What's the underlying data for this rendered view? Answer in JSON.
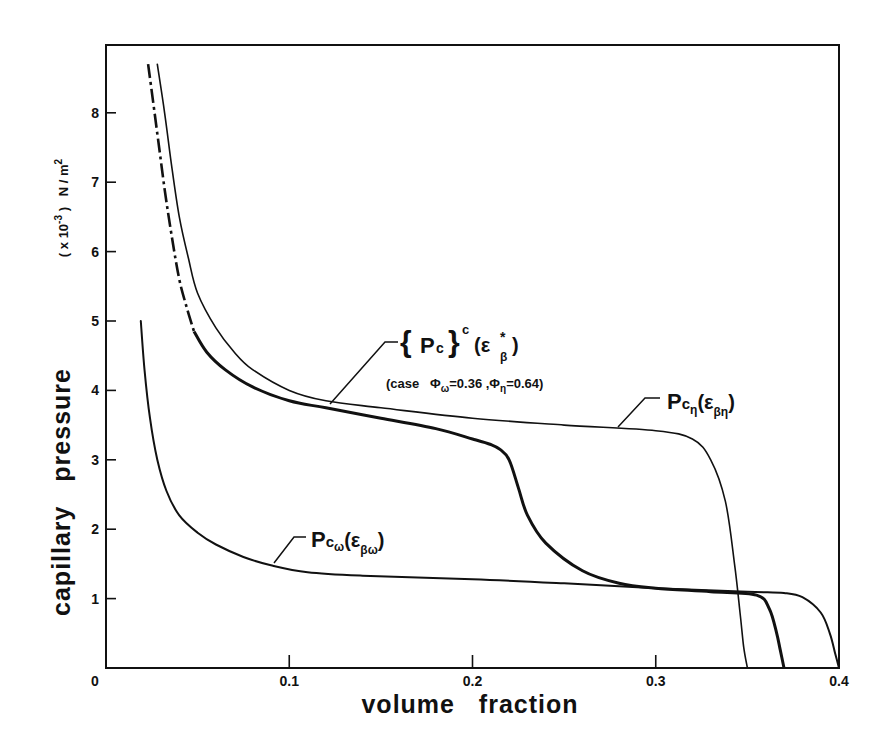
{
  "chart_data": {
    "type": "line",
    "title": "",
    "xlabel": "volume   fraction",
    "ylabel": "capillary   pressure",
    "ylabel_units": "( x10-3 )  N / m2",
    "xlim": [
      0,
      0.4
    ],
    "ylim": [
      0,
      9
    ],
    "grid": false,
    "legend": "inline annotations",
    "x_ticks": [
      "0",
      "0.1",
      "0.2",
      "0.3",
      "0.4"
    ],
    "y_ticks": [
      "0",
      "1",
      "2",
      "3",
      "4",
      "5",
      "6",
      "7",
      "8"
    ],
    "series": [
      {
        "name": "Pcη(εβη)",
        "style": "thin solid",
        "x": [
          0.028,
          0.032,
          0.036,
          0.04,
          0.045,
          0.05,
          0.06,
          0.07,
          0.08,
          0.1,
          0.12,
          0.15,
          0.2,
          0.25,
          0.3,
          0.32,
          0.33,
          0.338,
          0.343,
          0.346,
          0.348,
          0.35
        ],
        "values": [
          8.7,
          8.0,
          7.2,
          6.5,
          5.9,
          5.4,
          4.9,
          4.55,
          4.3,
          4.0,
          3.85,
          3.75,
          3.6,
          3.5,
          3.42,
          3.3,
          3.0,
          2.4,
          1.5,
          0.8,
          0.3,
          0.0
        ]
      },
      {
        "name": "{Pc}c(εβ*)",
        "note": "case Φω=0.36, Φη=0.64",
        "style": "thick solid (dash-dot for x<0.048)",
        "x": [
          0.023,
          0.028,
          0.032,
          0.036,
          0.04,
          0.044,
          0.048,
          0.055,
          0.065,
          0.08,
          0.1,
          0.12,
          0.15,
          0.18,
          0.2,
          0.21,
          0.215,
          0.22,
          0.225,
          0.23,
          0.24,
          0.26,
          0.28,
          0.3,
          0.33,
          0.355,
          0.362,
          0.366,
          0.368,
          0.37
        ],
        "values": [
          8.7,
          7.7,
          6.9,
          6.2,
          5.6,
          5.2,
          4.85,
          4.55,
          4.3,
          4.05,
          3.85,
          3.75,
          3.6,
          3.45,
          3.3,
          3.22,
          3.15,
          3.0,
          2.6,
          2.2,
          1.8,
          1.4,
          1.22,
          1.15,
          1.1,
          1.05,
          0.85,
          0.5,
          0.25,
          0.0
        ]
      },
      {
        "name": "Pcω(εβω)",
        "style": "medium solid",
        "x": [
          0.019,
          0.021,
          0.024,
          0.028,
          0.033,
          0.04,
          0.05,
          0.06,
          0.075,
          0.09,
          0.11,
          0.14,
          0.2,
          0.25,
          0.3,
          0.35,
          0.37,
          0.38,
          0.39,
          0.395,
          0.398,
          0.4
        ],
        "values": [
          5.0,
          4.3,
          3.6,
          3.0,
          2.55,
          2.2,
          1.95,
          1.78,
          1.6,
          1.48,
          1.38,
          1.33,
          1.28,
          1.22,
          1.15,
          1.1,
          1.08,
          1.02,
          0.8,
          0.5,
          0.2,
          0.0
        ]
      }
    ],
    "annotations": [
      {
        "text_main": "{ Pc }",
        "sup": "c",
        "args": "(ε",
        "args_sub": "β",
        "args_sup": "*",
        "close": ")"
      },
      {
        "text": "(case  Φω=0.36 ,Φη=0.64)"
      },
      {
        "text_main": "Pc",
        "sub": "η",
        "args": "(ε",
        "args_sub": "βη",
        "close": ")"
      },
      {
        "text_main": "Pc",
        "sub": "ω",
        "args": "(ε",
        "args_sub": "βω",
        "close": ")"
      }
    ]
  },
  "labels": {
    "xlabel": "volume   fraction",
    "ylabel": "capillary   pressure",
    "yunit_prefix": "( x 10",
    "yunit_exp": "-3",
    "yunit_suffix": " )   N / m",
    "yunit_sq": "2",
    "ann_pc_c_main": "{ P",
    "ann_pc_c_sub": "c",
    "ann_pc_c_brace": "}",
    "ann_pc_c_sup": "c",
    "ann_pc_c_arg": "(ε",
    "ann_pc_c_arg_sub": "β",
    "ann_pc_c_arg_sup": "*",
    "ann_pc_c_close": ")",
    "ann_case_prefix": "(case   Φ",
    "ann_case_w_sub": "ω",
    "ann_case_w_val": "=0.36 ,Φ",
    "ann_case_n_sub": "η",
    "ann_case_n_val": "=0.64)",
    "ann_pcn_main": "P",
    "ann_pcn_c": "c",
    "ann_pcn_sub": "η",
    "ann_pcn_arg": "(ε",
    "ann_pcn_arg_sub": "βη",
    "ann_pcn_close": ")",
    "ann_pcw_main": "P",
    "ann_pcw_c": "c",
    "ann_pcw_sub": "ω",
    "ann_pcw_arg": "(ε",
    "ann_pcw_arg_sub": "βω",
    "ann_pcw_close": ")"
  },
  "colors": {
    "ink": "#111111",
    "background": "#ffffff"
  }
}
